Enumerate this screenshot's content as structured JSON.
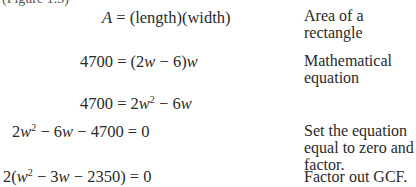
{
  "header_fragment": "(Figure 1.5)",
  "steps": [
    {
      "lhs": "A",
      "rhs": "(length)(width)",
      "note": "Area of a rectangle"
    },
    {
      "lhs": "4700",
      "rhs_parts": [
        "(2",
        "w",
        " − 6)",
        "w"
      ],
      "note": "Mathematical equation"
    },
    {
      "lhs": "4700",
      "rhs_parts": [
        "2",
        "w",
        "2",
        " − 6",
        "w"
      ],
      "note": ""
    },
    {
      "lhs_parts": [
        "2",
        "w",
        "2",
        " − 6",
        "w",
        " − 4700"
      ],
      "rhs": "0",
      "note": "Set the equation equal to zero and factor."
    },
    {
      "lhs_parts": [
        "2(",
        "w",
        "2",
        " − 3",
        "w",
        " − 2350)"
      ],
      "rhs": "0",
      "note": "Factor out GCF."
    }
  ],
  "eq_sign": "="
}
